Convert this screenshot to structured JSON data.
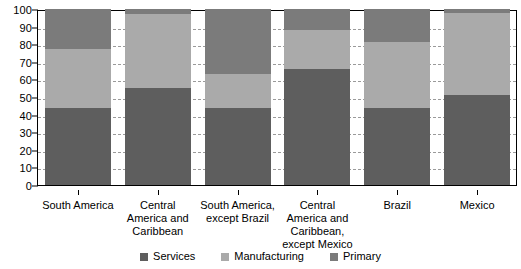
{
  "chart_data": {
    "type": "bar",
    "title": "",
    "subtitle": "",
    "xlabel": "",
    "ylabel": "",
    "stacked": true,
    "orientation": "vertical",
    "ylim": [
      0,
      100
    ],
    "yticks": [
      0,
      10,
      20,
      30,
      40,
      50,
      60,
      70,
      80,
      90,
      100
    ],
    "ytick_labels": [
      "0",
      "10",
      "20",
      "30",
      "40",
      "50",
      "60",
      "70",
      "80",
      "90",
      "100"
    ],
    "grid": "horizontal-dashed",
    "legend_position": "bottom-center",
    "categories": [
      "South America",
      "Central America and Caribbean",
      "South America, except Brazil",
      "Central America and Caribbean, except Mexico",
      "Brazil",
      "Mexico"
    ],
    "category_lines": [
      [
        "South America"
      ],
      [
        "Central",
        "America and",
        "Caribbean"
      ],
      [
        "South America,",
        "except Brazil"
      ],
      [
        "Central",
        "America and",
        "Caribbean,",
        "except Mexico"
      ],
      [
        "Brazil"
      ],
      [
        "Mexico"
      ]
    ],
    "series": [
      {
        "name": "Services",
        "color": "#5e5e5e",
        "values": [
          44,
          55,
          44,
          66,
          44,
          51
        ]
      },
      {
        "name": "Manufacturing",
        "color": "#aaaaaa",
        "values": [
          33,
          42,
          19,
          22,
          37,
          47
        ]
      },
      {
        "name": "Primary",
        "color": "#7b7b7b",
        "values": [
          23,
          3,
          37,
          12,
          19,
          2
        ]
      }
    ],
    "cumulative_tops": [
      [
        44,
        77,
        100
      ],
      [
        55,
        97,
        100
      ],
      [
        44,
        63,
        100
      ],
      [
        66,
        88,
        100
      ],
      [
        44,
        81,
        100
      ],
      [
        51,
        98,
        100
      ]
    ]
  },
  "legend": {
    "items": [
      {
        "label": "Services",
        "color": "#5e5e5e"
      },
      {
        "label": "Manufacturing",
        "color": "#aaaaaa"
      },
      {
        "label": "Primary",
        "color": "#7b7b7b"
      }
    ]
  },
  "colors": {
    "axis": "#000000",
    "grid": "#9a9a9a",
    "background": "#ffffff",
    "services": "#5e5e5e",
    "manufacturing": "#aaaaaa",
    "primary": "#7b7b7b"
  }
}
